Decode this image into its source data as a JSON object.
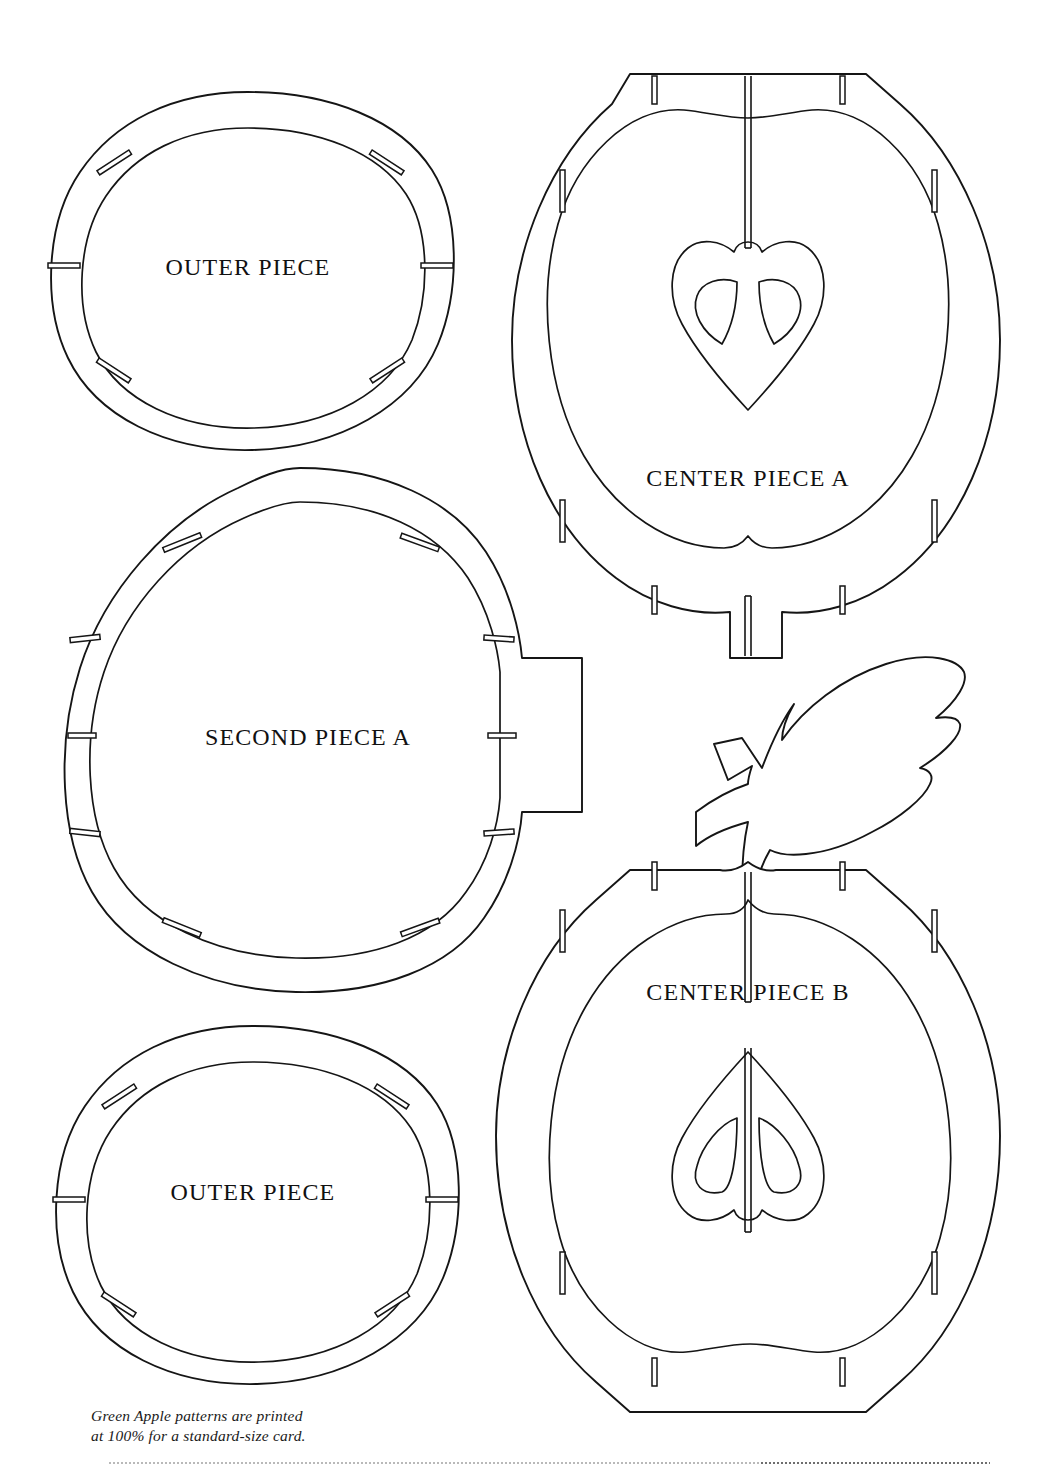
{
  "sheet": {
    "title": "Green Apple Pattern Sheet",
    "width": 1056,
    "height": 1471,
    "background_color": "#ffffff",
    "ink_color": "#151515"
  },
  "pieces": [
    {
      "id": "outer-piece-top",
      "label": "OUTER PIECE",
      "shape": "rounded-disc-with-inner-ring",
      "label_x": 248,
      "label_y": 275,
      "slot_count": 6
    },
    {
      "id": "center-piece-a",
      "label": "CENTER PIECE A",
      "shape": "apple-cross-section-core-down",
      "label_x": 748,
      "label_y": 486,
      "slot_count": 8,
      "has_stem_tab": true,
      "has_heart_core": true,
      "seed_count": 2
    },
    {
      "id": "second-piece-a",
      "label": "SECOND PIECE A",
      "shape": "rounded-disc-with-side-tab",
      "label_x": 308,
      "label_y": 745,
      "slot_count": 8,
      "has_side_tab": true
    },
    {
      "id": "leaf-stem",
      "label": "",
      "shape": "serrated-leaf-with-forked-stem",
      "slot_count": 0
    },
    {
      "id": "center-piece-b",
      "label": "CENTER PIECE B",
      "shape": "apple-cross-section-core-up",
      "label_x": 748,
      "label_y": 1000,
      "slot_count": 8,
      "has_heart_core": true,
      "seed_count": 2
    },
    {
      "id": "outer-piece-bottom",
      "label": "OUTER PIECE",
      "shape": "rounded-disc-with-inner-ring",
      "label_x": 253,
      "label_y": 1200,
      "slot_count": 6
    }
  ],
  "footnote": {
    "line1": "Green Apple patterns are printed",
    "line2": "at 100% for a standard-size card."
  }
}
